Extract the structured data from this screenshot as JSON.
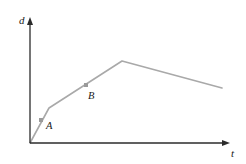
{
  "figure": {
    "kind": "distance-time-graph",
    "background_color": "#ffffff",
    "axes": {
      "y_label": "d",
      "x_label": "t",
      "axis_color": "#2b2b2b",
      "origin": [
        30,
        143
      ],
      "y_top": [
        30,
        17
      ],
      "x_right": [
        230,
        143
      ]
    },
    "curve": {
      "color": "#a9a9a9",
      "width": 1.6,
      "points": [
        [
          30,
          143
        ],
        [
          49,
          108
        ],
        [
          122,
          61
        ],
        [
          222,
          88
        ]
      ]
    },
    "markers": [
      {
        "label": "A",
        "marker_x": 41,
        "marker_y": 120,
        "label_x": 46,
        "label_y": 129,
        "color": "#9a9a9a"
      },
      {
        "label": "B",
        "marker_x": 86,
        "marker_y": 85,
        "label_x": 88,
        "label_y": 99,
        "color": "#9a9a9a"
      }
    ],
    "y_label_pos": [
      19,
      24
    ],
    "x_label_pos": [
      231,
      157
    ]
  },
  "chart_data": {
    "type": "line",
    "title": "",
    "xlabel": "t",
    "ylabel": "d",
    "grid": false,
    "legend": null,
    "annotations": [
      "A",
      "B"
    ],
    "series": [
      {
        "name": "d(t)",
        "x": [
          0,
          0.095,
          0.46,
          0.96
        ],
        "y": [
          0,
          0.277,
          0.651,
          0.437
        ]
      }
    ],
    "labeled_points": [
      {
        "name": "A",
        "x": 0.055,
        "y": 0.183
      },
      {
        "name": "B",
        "x": 0.28,
        "y": 0.46
      }
    ],
    "xlim": [
      0,
      1
    ],
    "ylim": [
      0,
      1
    ]
  }
}
